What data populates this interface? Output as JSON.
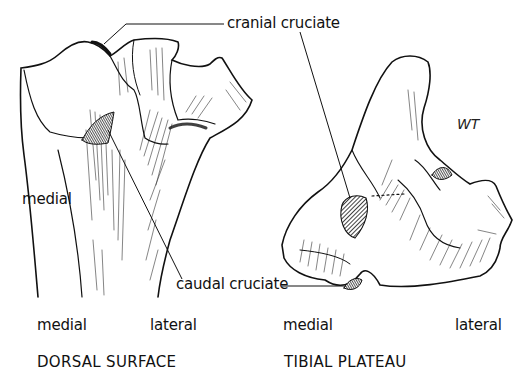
{
  "figure": {
    "panels": [
      {
        "id": "dorsal-surface",
        "caption": "DORSAL SURFACE",
        "orientation_labels": {
          "left": "medial",
          "right": "lateral"
        },
        "side_label": "medial"
      },
      {
        "id": "tibial-plateau",
        "caption": "TIBIAL PLATEAU",
        "orientation_labels": {
          "left": "medial",
          "right": "lateral"
        }
      }
    ],
    "annotations": {
      "cranial": "cranial cruciate",
      "caudal": "caudal cruciate"
    },
    "signature": "WT",
    "colors": {
      "ink": "#111111",
      "background": "#ffffff"
    }
  }
}
